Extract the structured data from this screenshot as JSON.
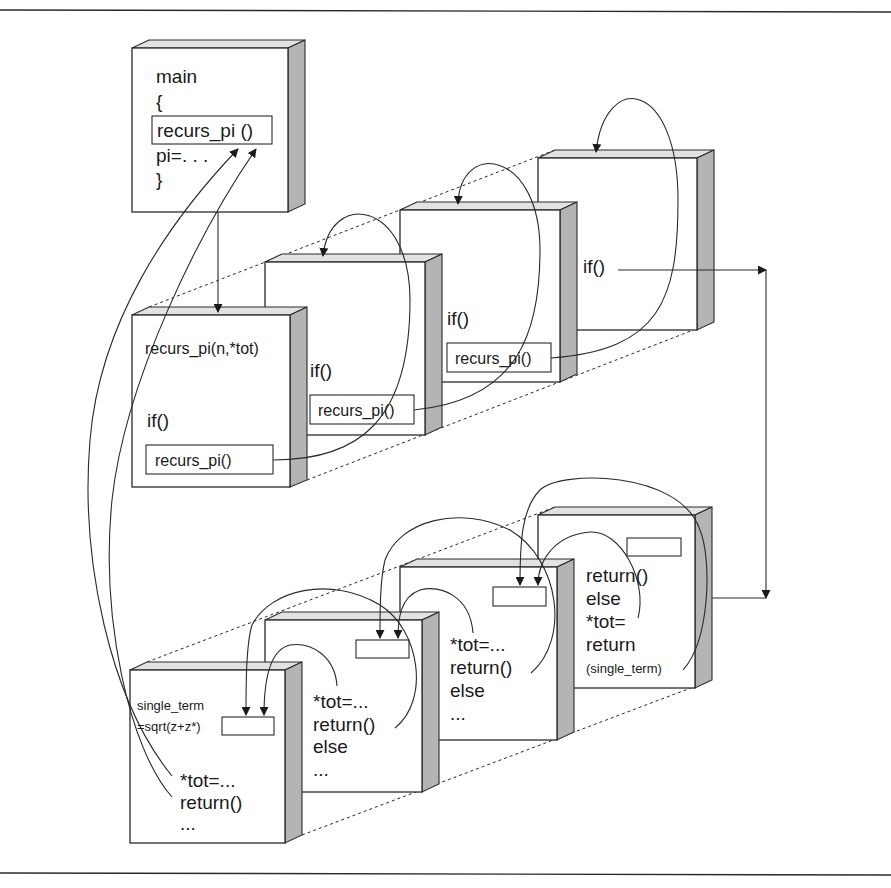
{
  "figure": {
    "main_frame": {
      "lines": [
        "main",
        "{",
        "recurs_pi ()",
        "pi=. . .",
        "}"
      ]
    },
    "call_frames": [
      {
        "label": "recurs_pi(n,*tot)",
        "cond": "if()",
        "call": "recurs_pi()"
      },
      {
        "label": "",
        "cond": "if()",
        "call": "recurs_pi()"
      },
      {
        "label": "",
        "cond": "if()",
        "call": "recurs_pi()"
      },
      {
        "label": "",
        "cond": "if()",
        "call": ""
      }
    ],
    "return_frames": [
      {
        "lines": [
          "single_term",
          "=sqrt(z+z*)",
          "*tot=...",
          "return()",
          "..."
        ]
      },
      {
        "lines": [
          "*tot=...",
          "return()",
          "else",
          "..."
        ]
      },
      {
        "lines": [
          "*tot=...",
          "return()",
          "else",
          "..."
        ]
      },
      {
        "lines": [
          "return()",
          "else",
          "*tot=",
          "return",
          "(single_term)"
        ]
      }
    ]
  },
  "colors": {
    "line": "#2a2a2a",
    "side_face": "#b4b4b4",
    "top_face": "#e2e2e2",
    "background": "#ffffff"
  }
}
